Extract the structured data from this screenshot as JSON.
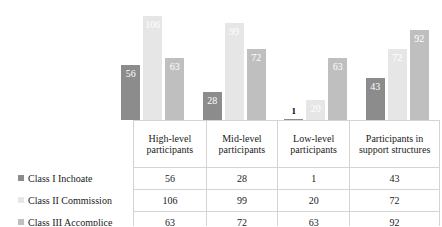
{
  "chart_data": {
    "type": "bar",
    "title": "",
    "subtitle": "",
    "xlabel": "",
    "ylabel": "",
    "ylim": [
      0,
      118
    ],
    "grid": false,
    "legend_position": "left-table",
    "categories": [
      "High-level participants",
      "Mid-level participants",
      "Low-level participants",
      "Participants in support structures"
    ],
    "series": [
      {
        "name": "Class I Inchoate",
        "color": "#8c8c8c",
        "values": [
          56,
          28,
          1,
          43
        ]
      },
      {
        "name": "Class II Commission",
        "color": "#e6e6e6",
        "values": [
          106,
          99,
          20,
          72
        ]
      },
      {
        "name": "Class III Accomplice",
        "color": "#bfbfbf",
        "values": [
          63,
          72,
          63,
          92
        ]
      }
    ],
    "data_labels": [
      [
        "56",
        "28",
        "1",
        "43"
      ],
      [
        "106",
        "99",
        "20",
        "72"
      ],
      [
        "63",
        "72",
        "63",
        "92"
      ]
    ]
  },
  "table": {
    "corner_label": "",
    "column_headers": [
      "High-level participants",
      "Mid-level participants",
      "Low-level participants",
      "Participants in support structures"
    ],
    "rows": [
      {
        "label": "Class I Inchoate",
        "swatch": "#8c8c8c",
        "values": [
          "56",
          "28",
          "1",
          "43"
        ]
      },
      {
        "label": "Class II Commission",
        "swatch": "#e6e6e6",
        "values": [
          "106",
          "99",
          "20",
          "72"
        ]
      },
      {
        "label": "Class III Accomplice",
        "swatch": "#bfbfbf",
        "values": [
          "63",
          "72",
          "63",
          "92"
        ]
      }
    ]
  },
  "style": {
    "background": "#ffffff",
    "grid_line": "#d4d4d4",
    "label_text": "#ffffff",
    "outside_label_text": "#000000"
  }
}
